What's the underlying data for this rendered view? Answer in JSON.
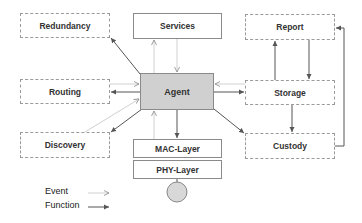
{
  "diagram": {
    "nodes": {
      "redundancy": {
        "label": "Redundancy",
        "style": "dashed"
      },
      "services": {
        "label": "Services",
        "style": "solid"
      },
      "report": {
        "label": "Report",
        "style": "dashed"
      },
      "routing": {
        "label": "Routing",
        "style": "dashed"
      },
      "agent": {
        "label": "Agent",
        "style": "filled"
      },
      "storage": {
        "label": "Storage",
        "style": "dashed"
      },
      "discovery": {
        "label": "Discovery",
        "style": "dashed"
      },
      "mac_layer": {
        "label": "MAC-Layer",
        "style": "solid"
      },
      "phy_layer": {
        "label": "PHY-Layer",
        "style": "solid"
      },
      "custody": {
        "label": "Custody",
        "style": "dashed"
      }
    },
    "edges": [
      {
        "from": "agent",
        "to": "redundancy",
        "type": "function"
      },
      {
        "from": "agent",
        "to": "routing",
        "type": "function"
      },
      {
        "from": "routing",
        "to": "agent",
        "type": "event"
      },
      {
        "from": "agent",
        "to": "discovery",
        "type": "function"
      },
      {
        "from": "discovery",
        "to": "agent",
        "type": "event"
      },
      {
        "from": "agent",
        "to": "services",
        "type": "event"
      },
      {
        "from": "services",
        "to": "agent",
        "type": "event"
      },
      {
        "from": "agent",
        "to": "storage",
        "type": "function"
      },
      {
        "from": "storage",
        "to": "agent",
        "type": "event"
      },
      {
        "from": "agent",
        "to": "custody",
        "type": "function"
      },
      {
        "from": "agent",
        "to": "mac_layer",
        "type": "function"
      },
      {
        "from": "mac_layer",
        "to": "agent",
        "type": "event"
      },
      {
        "from": "storage",
        "to": "report",
        "type": "function"
      },
      {
        "from": "report",
        "to": "storage",
        "type": "function"
      },
      {
        "from": "storage",
        "to": "custody",
        "type": "function"
      },
      {
        "from": "custody",
        "to": "report",
        "type": "function"
      }
    ],
    "legend": {
      "event_label": "Event",
      "function_label": "Function"
    },
    "colors": {
      "agent_fill": "#d0d0d0",
      "function_line": "#555555",
      "event_line": "#c8c8c8",
      "circle_fill": "#d8d8d8"
    }
  }
}
